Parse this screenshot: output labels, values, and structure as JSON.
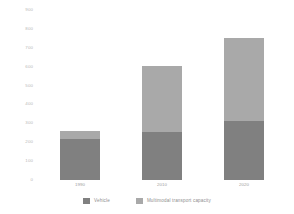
{
  "chart_data": {
    "type": "bar",
    "stacked": true,
    "title": "",
    "subtitle": "",
    "xlabel": "",
    "ylabel": "",
    "categories": [
      "1990",
      "2010",
      "2020"
    ],
    "series": [
      {
        "name": "Vehicle",
        "values": [
          215,
          255,
          310
        ],
        "color": "#808080"
      },
      {
        "name": "Multimodal transport capacity",
        "values": [
          45,
          350,
          440
        ],
        "color": "#a9a9a9"
      }
    ],
    "totals": [
      260,
      605,
      750
    ],
    "ylim": [
      0,
      900
    ],
    "ytick_step": 100,
    "yticks": [
      "900",
      "800",
      "700",
      "600",
      "500",
      "400",
      "300",
      "200",
      "100",
      "0"
    ],
    "grid": false,
    "legend_position": "bottom"
  },
  "axis": {
    "y_tick_labels": [
      "900",
      "800",
      "700",
      "600",
      "500",
      "400",
      "300",
      "200",
      "100",
      "0"
    ],
    "x_tick_labels": [
      "1990",
      "2010",
      "2020"
    ]
  },
  "legend": {
    "items": [
      {
        "label": "Vehicle",
        "color": "#808080"
      },
      {
        "label": "Multimodal transport capacity",
        "color": "#a9a9a9"
      }
    ]
  },
  "colors": {
    "vehicle": "#808080",
    "multimodal": "#a9a9a9",
    "tick_text": "#b9b9b9",
    "background": "#ffffff"
  }
}
